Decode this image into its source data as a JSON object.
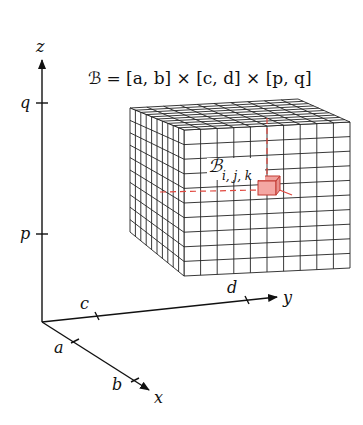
{
  "diagram": {
    "title": "ℬ = [a, b] × [c, d] × [p, q]",
    "subbox_label": "ℬ",
    "subbox_subscript": "i, j, k",
    "axes": {
      "z": {
        "label": "z",
        "ticks": [
          "q",
          "p"
        ]
      },
      "y": {
        "label": "y",
        "ticks": [
          "c",
          "d"
        ]
      },
      "x": {
        "label": "x",
        "ticks": [
          "a",
          "b"
        ]
      }
    },
    "grid": {
      "divisions": 10
    },
    "colors": {
      "lines": "#111111",
      "highlight": "#e0483f",
      "highlight_fill": "#f4a7a3",
      "background": "#ffffff"
    }
  }
}
